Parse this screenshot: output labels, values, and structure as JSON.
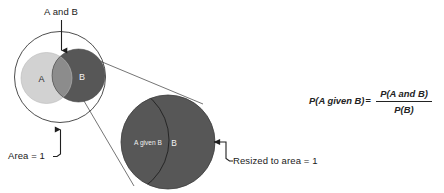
{
  "figure": {
    "title_caption": "",
    "background_color": "#ffffff",
    "colors": {
      "set_a_fill": "#d2d2d2",
      "set_b_fill": "#575757",
      "intersection_fill": "#8c8c8c",
      "enlarged_circle_fill": "#575757",
      "outline_stroke": "#2e2e2e",
      "leader_stroke": "#1f1f1f",
      "label_dark": "#1a1a1a",
      "label_light": "#f2f2f2"
    }
  },
  "venn": {
    "universe_label": "Area = 1",
    "intersection_callout": "A and B",
    "set_a_label": "A",
    "set_b_label": "B"
  },
  "magnified": {
    "conditional_region_label": "A given B",
    "set_b_label": "B",
    "resize_callout": "Resized to area = 1"
  },
  "formula": {
    "left_side": "P(A given B)",
    "equals": "=",
    "numerator": "P(A and B)",
    "denominator": "P(B)"
  }
}
